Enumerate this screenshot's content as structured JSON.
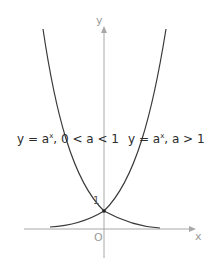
{
  "diagram": {
    "type": "function-graph",
    "axes": {
      "x_label": "x",
      "y_label": "y",
      "origin_label": "O",
      "axis_color": "#a8a8a8"
    },
    "intersection": {
      "label": "1",
      "point": [
        0,
        1
      ]
    },
    "curves": [
      {
        "id": "decreasing",
        "label_prefix": "y = a",
        "label_exponent": "x",
        "label_condition": ", 0 < a < 1",
        "color": "#3a3a3a"
      },
      {
        "id": "increasing",
        "label_prefix": "y = a",
        "label_exponent": "x",
        "label_condition": ", a > 1",
        "color": "#3a3a3a"
      }
    ]
  }
}
